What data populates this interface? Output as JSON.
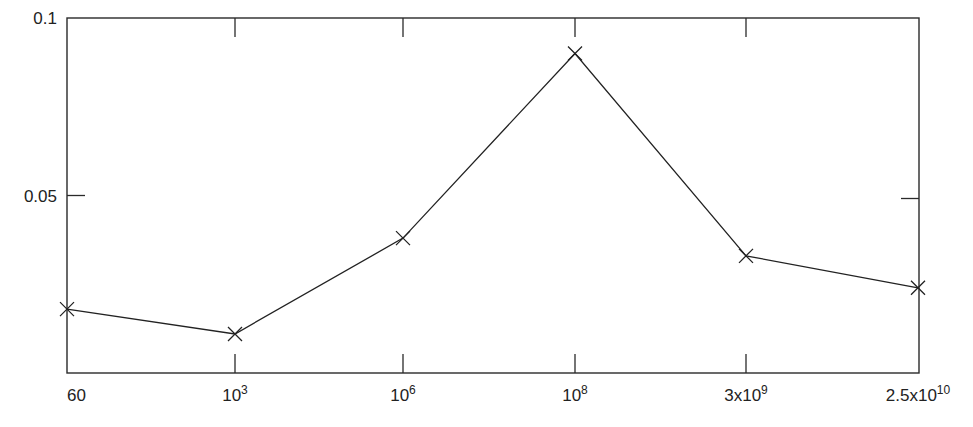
{
  "chart_data": {
    "type": "line",
    "title": "",
    "xlabel": "",
    "ylabel": "",
    "x_scale": "categorical (uneven, roughly log-spaced labels)",
    "categories": [
      "60",
      "10^3",
      "10^6",
      "10^8",
      "3x10^9",
      "2.5x10^10"
    ],
    "x_tick_labels": [
      {
        "base": "60",
        "exp": ""
      },
      {
        "base": "10",
        "exp": "3"
      },
      {
        "base": "10",
        "exp": "6"
      },
      {
        "base": "10",
        "exp": "8"
      },
      {
        "base": "3x10",
        "exp": "9"
      },
      {
        "base": "2.5x10",
        "exp": "10"
      }
    ],
    "series": [
      {
        "name": "series-1",
        "marker": "x",
        "color": "#222222",
        "values": [
          0.018,
          0.011,
          0.038,
          0.09,
          0.033,
          0.024
        ]
      }
    ],
    "y_ticks": [
      0.05,
      0.1
    ],
    "y_tick_labels": [
      "0.05",
      "0.1"
    ],
    "ylim": [
      0,
      0.1
    ],
    "grid": false,
    "legend": "none"
  }
}
